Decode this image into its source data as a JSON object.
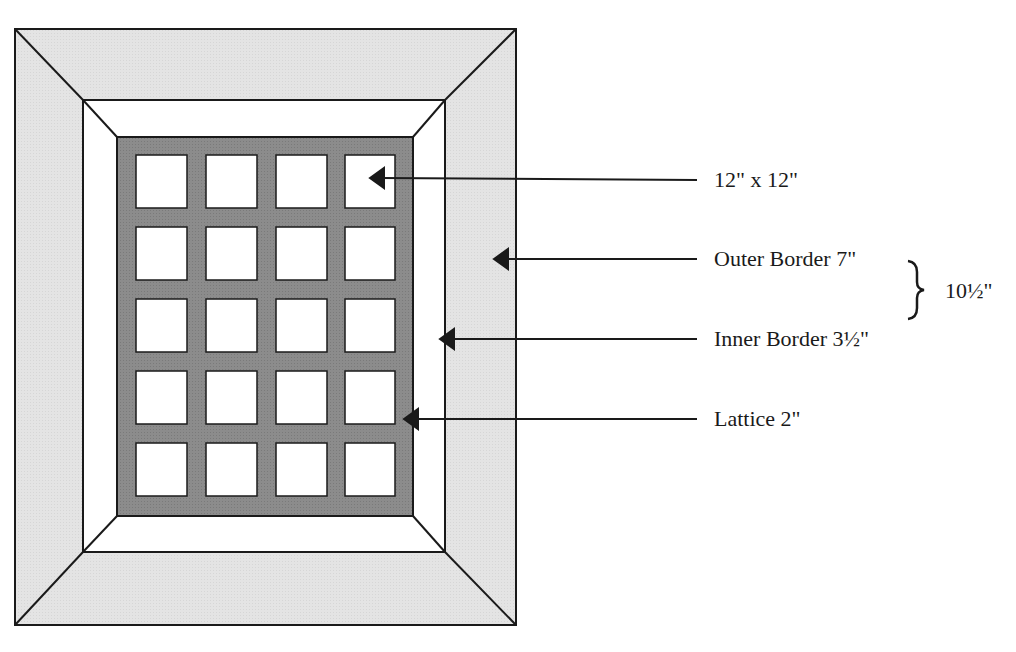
{
  "diagram": {
    "colors": {
      "outer_border": "#e6e6e6",
      "inner_border": "#ffffff",
      "lattice": "#8a8a8a",
      "block": "#ffffff",
      "stroke": "#1a1a1a"
    },
    "grid": {
      "columns": 4,
      "rows": 5
    },
    "labels": [
      {
        "id": "block",
        "text": "12\" x 12\""
      },
      {
        "id": "outer_border",
        "text": "Outer Border 7\""
      },
      {
        "id": "inner_border",
        "text": "Inner Border 3½\""
      },
      {
        "id": "lattice",
        "text": "Lattice 2\""
      }
    ],
    "brace": {
      "text": "10½\""
    }
  }
}
